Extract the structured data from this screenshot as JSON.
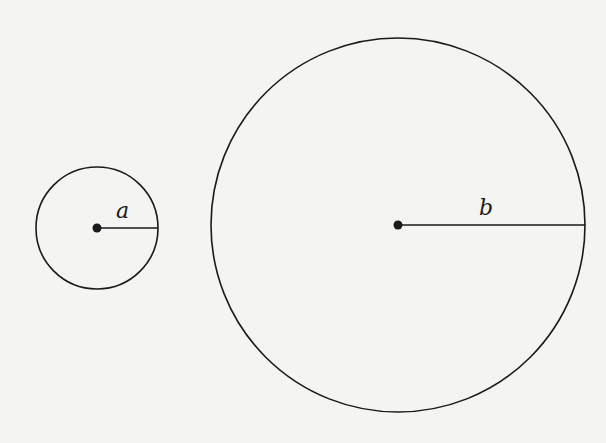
{
  "diagram": {
    "background": "#f4f4f2",
    "stroke_color": "#1a1a1a",
    "circles": [
      {
        "name": "small-circle",
        "cx": 97,
        "cy": 228,
        "r": 61,
        "radius_label": "a",
        "label_x": 116,
        "label_y": 200
      },
      {
        "name": "large-circle",
        "cx": 398,
        "cy": 225,
        "r": 187,
        "radius_label": "b",
        "label_x": 479,
        "label_y": 197
      }
    ]
  }
}
